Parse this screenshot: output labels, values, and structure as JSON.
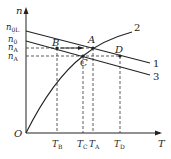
{
  "axes": {
    "x_label": "T",
    "y_label": "n",
    "origin_label": "O"
  },
  "y_ticks": [
    {
      "main": "n",
      "sub": "0L",
      "prime": ""
    },
    {
      "main": "n",
      "sub": "0",
      "prime": "′"
    },
    {
      "main": "n",
      "sub": "A",
      "prime": ""
    },
    {
      "main": "n",
      "sub": "A",
      "prime": "′"
    }
  ],
  "x_ticks": [
    {
      "main": "T",
      "sub": "B"
    },
    {
      "main": "T",
      "sub": "C"
    },
    {
      "main": "T",
      "sub": "A"
    },
    {
      "main": "T",
      "sub": "D"
    }
  ],
  "points": {
    "A": "A",
    "B": "B",
    "C": "C",
    "D": "D"
  },
  "curves": {
    "c1": "1",
    "c2": "2",
    "c3": "3"
  },
  "colors": {
    "line": "#222222",
    "dash": "#333333"
  }
}
